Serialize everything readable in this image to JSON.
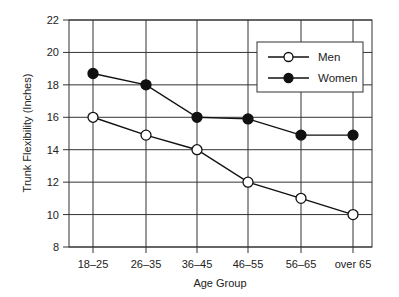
{
  "chart_data": {
    "type": "line",
    "title": "",
    "xlabel": "Age Group",
    "ylabel": "Trunk Flexibility (Inches)",
    "categories": [
      "18–25",
      "26–35",
      "36–45",
      "46–55",
      "56–65",
      "over 65"
    ],
    "yticks": [
      8,
      10,
      12,
      14,
      16,
      18,
      20,
      22
    ],
    "ylim": [
      8,
      22
    ],
    "grid": true,
    "legend_position": "upper right",
    "series": [
      {
        "name": "Men",
        "marker": "open-circle",
        "values": [
          16,
          14.9,
          14,
          12,
          11,
          10
        ]
      },
      {
        "name": "Women",
        "marker": "filled-circle",
        "values": [
          18.7,
          18,
          16,
          15.9,
          14.9,
          14.9
        ]
      }
    ]
  },
  "colors": {
    "line": "#111111",
    "grid": "#333333",
    "marker_open_fill": "#ffffff",
    "marker_filled_fill": "#111111"
  }
}
